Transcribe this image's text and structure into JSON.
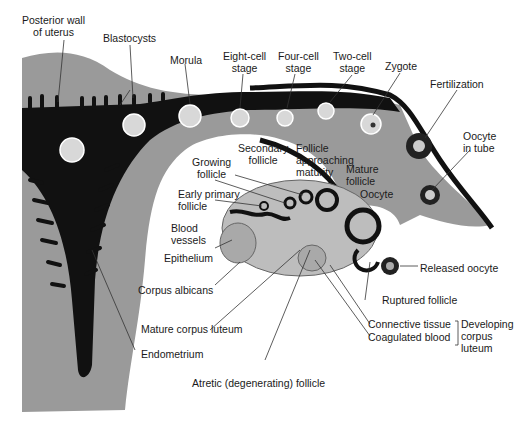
{
  "diagram": {
    "labels": {
      "posterior_wall": [
        "Posterior wall",
        "of uterus"
      ],
      "blastocysts": "Blastocysts",
      "morula": "Morula",
      "eight_cell": [
        "Eight-cell",
        "stage"
      ],
      "four_cell": [
        "Four-cell",
        "stage"
      ],
      "two_cell": [
        "Two-cell",
        "stage"
      ],
      "zygote": "Zygote",
      "fertilization": "Fertilization",
      "oocyte_in_tube": [
        "Oocyte",
        "in tube"
      ],
      "secondary_follicle": [
        "Secondary",
        "follicle"
      ],
      "follicle_approaching": [
        "Follicle",
        "approaching",
        "maturity"
      ],
      "mature_follicle": [
        "Mature",
        "follicle"
      ],
      "oocyte": "Oocyte",
      "growing_follicle": [
        "Growing",
        "follicle"
      ],
      "early_primary": [
        "Early primary",
        "follicle"
      ],
      "blood_vessels": [
        "Blood",
        "vessels"
      ],
      "epithelium": "Epithelium",
      "corpus_albicans": "Corpus albicans",
      "mature_corpus_luteum": "Mature corpus luteum",
      "endometrium": "Endometrium",
      "atretic": "Atretic (degenerating) follicle",
      "released_oocyte": "Released oocyte",
      "ruptured_follicle": "Ruptured follicle",
      "connective_tissue": "Connective tissue",
      "coagulated_blood": "Coagulated blood",
      "developing_corpus_luteum": [
        "Developing",
        "corpus",
        "luteum"
      ]
    },
    "colors": {
      "tissue": "#9a9a9a",
      "lumen": "#111111",
      "cell": "#d8d8d8",
      "ovary": "#bdbdbd"
    }
  }
}
